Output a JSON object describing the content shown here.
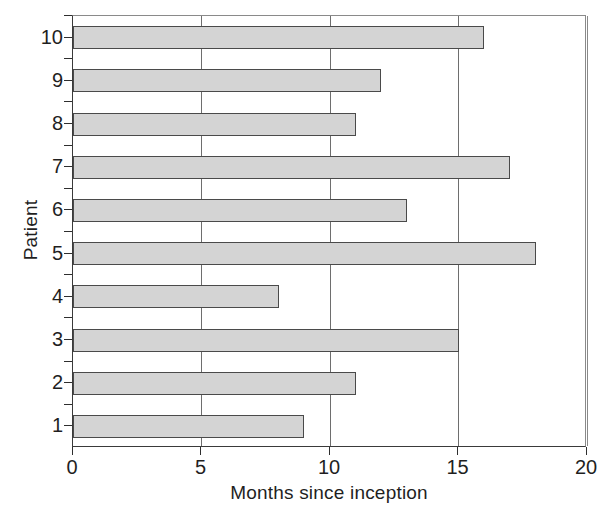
{
  "chart_data": {
    "type": "bar",
    "orientation": "horizontal",
    "title": "",
    "xlabel": "Months since inception",
    "ylabel": "Patient",
    "categories": [
      "1",
      "2",
      "3",
      "4",
      "5",
      "6",
      "7",
      "8",
      "9",
      "10"
    ],
    "values": [
      9,
      11,
      15,
      8,
      18,
      13,
      17,
      11,
      12,
      16
    ],
    "series": [
      {
        "name": "Months since inception",
        "values": [
          9,
          11,
          15,
          8,
          18,
          13,
          17,
          11,
          12,
          16
        ]
      }
    ],
    "xlim": [
      0,
      20
    ],
    "xticks": [
      0,
      5,
      10,
      15,
      20
    ],
    "xticklabels": [
      "0",
      "5",
      "10",
      "15",
      "20"
    ],
    "yticklabels": [
      "1",
      "2",
      "3",
      "4",
      "5",
      "6",
      "7",
      "8",
      "9",
      "10"
    ],
    "grid": "vertical",
    "legend": null,
    "bar_fill_color": "#d4d4d4",
    "bar_edge_color": "#4a4a4a",
    "axis_color": "#2e2e2e",
    "gridline_color": "#6e6e6e",
    "background_color": "#ffffff"
  }
}
